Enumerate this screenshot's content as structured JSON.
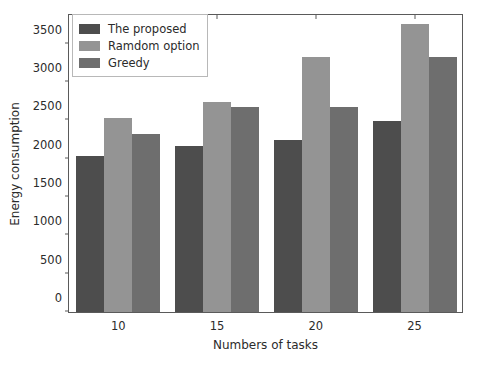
{
  "chart_data": {
    "type": "bar",
    "title": "",
    "xlabel": "Numbers of tasks",
    "ylabel": "Energy consumption",
    "categories": [
      "10",
      "15",
      "20",
      "25"
    ],
    "series": [
      {
        "name": "The proposed",
        "color": "#4d4d4d",
        "values": [
          2030,
          2170,
          2240,
          2490
        ]
      },
      {
        "name": "Ramdom option",
        "color": "#949494",
        "values": [
          2530,
          2740,
          3320,
          3760
        ]
      },
      {
        "name": "Greedy",
        "color": "#6e6e6e",
        "values": [
          2320,
          2670,
          2670,
          3320
        ]
      }
    ],
    "ylim": [
      0,
      3900
    ],
    "yticks": [
      0,
      500,
      1000,
      1500,
      2000,
      2500,
      3000,
      3500
    ],
    "ytick_labels": [
      "0",
      "500",
      "1000",
      "1500",
      "2000",
      "2500",
      "3000",
      "3500"
    ],
    "xtick_labels": [
      "10",
      "15",
      "20",
      "25"
    ],
    "grid": false,
    "legend_position": "upper left"
  }
}
